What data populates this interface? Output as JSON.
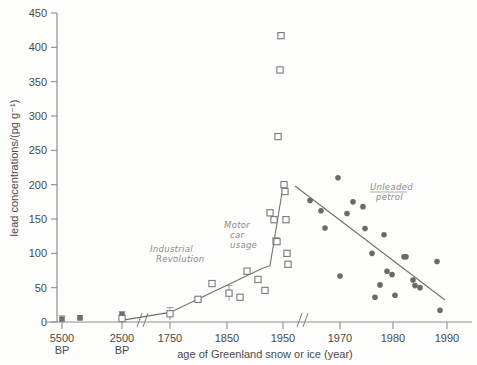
{
  "chart_data": {
    "type": "scatter",
    "title": "",
    "xlabel": "age of Greenland snow or ice (year)",
    "ylabel": "lead concentrations/(pg g⁻¹)",
    "ylim": [
      0,
      450
    ],
    "yticks": [
      0,
      50,
      100,
      150,
      200,
      250,
      300,
      350,
      400,
      450
    ],
    "ytick_labels": [
      "0",
      "50",
      "100",
      "150",
      "200",
      "250",
      "300",
      "350",
      "400",
      "450"
    ],
    "xtick_labels": [
      "5500\nBP",
      "2500\nBP",
      "1750",
      "1850",
      "1950",
      "1970",
      "1980",
      "1990"
    ],
    "xticks": [
      {
        "label": "5500",
        "sublabel": "BP",
        "px": 62
      },
      {
        "label": "2500",
        "sublabel": "BP",
        "px": 122
      },
      {
        "label": "1750",
        "sublabel": "",
        "px": 170
      },
      {
        "label": "1850",
        "sublabel": "",
        "px": 227
      },
      {
        "label": "1950",
        "sublabel": "",
        "px": 283
      },
      {
        "label": "1970",
        "sublabel": "",
        "px": 340
      },
      {
        "label": "1980",
        "sublabel": "",
        "px": 393
      },
      {
        "label": "1990",
        "sublabel": "",
        "px": 447
      }
    ],
    "axis_breaks": [
      {
        "name": "break-after-2500bp",
        "px": 140
      },
      {
        "name": "break-after-1950",
        "px": 300
      }
    ],
    "grid": false,
    "legend": "none",
    "series": [
      {
        "name": "ancient ice samples",
        "marker": "filled-square",
        "color": "#6e6e6e",
        "points": [
          {
            "px": 62,
            "value": 4
          },
          {
            "px": 80,
            "value": 6
          },
          {
            "px": 122,
            "value": 11
          }
        ]
      },
      {
        "name": "historical ice samples",
        "marker": "open-square",
        "color": "#7a7a7a",
        "points": [
          {
            "px": 122,
            "value": 5
          },
          {
            "px": 170,
            "value": 12
          },
          {
            "px": 198,
            "value": 33
          },
          {
            "px": 212,
            "value": 56
          },
          {
            "px": 229,
            "value": 42
          },
          {
            "px": 240,
            "value": 36
          },
          {
            "px": 247,
            "value": 74
          },
          {
            "px": 258,
            "value": 62
          },
          {
            "px": 265,
            "value": 46
          },
          {
            "px": 270,
            "value": 159
          },
          {
            "px": 274,
            "value": 149
          },
          {
            "px": 276,
            "value": 118
          },
          {
            "px": 277,
            "value": 117
          },
          {
            "px": 278,
            "value": 270
          },
          {
            "px": 280,
            "value": 367
          },
          {
            "px": 281,
            "value": 417
          },
          {
            "px": 284,
            "value": 200
          },
          {
            "px": 285,
            "value": 190
          },
          {
            "px": 286,
            "value": 149
          },
          {
            "px": 287,
            "value": 100
          },
          {
            "px": 288,
            "value": 84
          }
        ]
      },
      {
        "name": "unleaded petrol era snow",
        "marker": "filled-circle",
        "color": "#6a6a6a",
        "points": [
          {
            "px": 310,
            "value": 177
          },
          {
            "px": 321,
            "value": 162
          },
          {
            "px": 325,
            "value": 137
          },
          {
            "px": 338,
            "value": 210
          },
          {
            "px": 340,
            "value": 67
          },
          {
            "px": 347,
            "value": 158
          },
          {
            "px": 353,
            "value": 175
          },
          {
            "px": 363,
            "value": 168
          },
          {
            "px": 365,
            "value": 136
          },
          {
            "px": 372,
            "value": 100
          },
          {
            "px": 375,
            "value": 36
          },
          {
            "px": 380,
            "value": 54
          },
          {
            "px": 384,
            "value": 127
          },
          {
            "px": 387,
            "value": 74
          },
          {
            "px": 392,
            "value": 69
          },
          {
            "px": 395,
            "value": 39
          },
          {
            "px": 404,
            "value": 95
          },
          {
            "px": 406,
            "value": 95
          },
          {
            "px": 413,
            "value": 61
          },
          {
            "px": 415,
            "value": 53
          },
          {
            "px": 420,
            "value": 50
          },
          {
            "px": 437,
            "value": 88
          },
          {
            "px": 440,
            "value": 17
          }
        ]
      }
    ],
    "trend_lines": [
      {
        "name": "industrial-rise-line",
        "points": [
          {
            "px": 120,
            "value": 2
          },
          {
            "px": 170,
            "value": 14
          },
          {
            "px": 262,
            "value": 78
          },
          {
            "px": 270,
            "value": 82
          },
          {
            "px": 283,
            "value": 197
          }
        ]
      },
      {
        "name": "unleaded-decline-line",
        "points": [
          {
            "px": 295,
            "value": 198
          },
          {
            "px": 445,
            "value": 32
          }
        ]
      }
    ],
    "error_bars": [
      {
        "px": 62,
        "value": 4,
        "err": 5
      },
      {
        "px": 122,
        "value": 8,
        "err": 7
      },
      {
        "px": 170,
        "value": 12,
        "err": 9
      },
      {
        "px": 229,
        "value": 42,
        "err": 11
      }
    ],
    "annotations": [
      {
        "name": "industrial-revolution",
        "lines": [
          "Industrial",
          "Revolution"
        ],
        "px": 150,
        "py": 252
      },
      {
        "name": "motor-car-usage",
        "lines": [
          "Motor",
          "car",
          "usage"
        ],
        "px": 224,
        "py": 228
      },
      {
        "name": "unleaded-petrol",
        "lines": [
          "Unleaded",
          "petrol"
        ],
        "px": 370,
        "py": 190,
        "underline_first": true
      }
    ]
  }
}
